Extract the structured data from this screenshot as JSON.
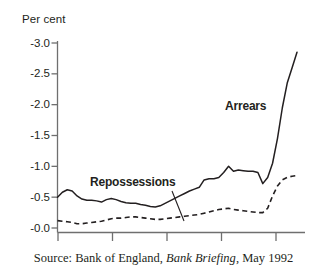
{
  "figure": {
    "axis_unit_label": "Per cent",
    "caption_prefix": "Source: Bank of England,",
    "caption_italic": "Bank Briefing",
    "caption_suffix": ", May 1992",
    "label_arrears": "Arrears",
    "label_repossessions": "Repossessions",
    "colors": {
      "ink": "#231f20",
      "axis": "#6f6f6f",
      "background": "#ffffff"
    }
  },
  "chart_data": {
    "type": "line",
    "title": "",
    "subtitle": "",
    "xlabel": "",
    "ylabel": "Per cent",
    "ylim": [
      0.0,
      3.0
    ],
    "ytick_labels": [
      "-3.0",
      "-2.5",
      "-2.0",
      "-1.5",
      "-1.0",
      "-0.5",
      "-0.0"
    ],
    "ytick_values": [
      3.0,
      2.5,
      2.0,
      1.5,
      1.0,
      0.5,
      0.0
    ],
    "xtick_labels": [
      "",
      "",
      "",
      "",
      ""
    ],
    "xtick_count": 5,
    "grid": false,
    "legend_position": "inline-annotations",
    "annotations": [
      {
        "text": "Arrears",
        "target_series": "Arrears",
        "style": "bold"
      },
      {
        "text": "Repossessions",
        "target_series": "Repossessions",
        "style": "bold",
        "leader_line": true
      }
    ],
    "series": [
      {
        "name": "Arrears",
        "style": "solid",
        "values": [
          0.5,
          0.58,
          0.62,
          0.6,
          0.52,
          0.47,
          0.45,
          0.45,
          0.44,
          0.42,
          0.46,
          0.48,
          0.46,
          0.43,
          0.41,
          0.4,
          0.4,
          0.38,
          0.37,
          0.35,
          0.34,
          0.36,
          0.4,
          0.44,
          0.48,
          0.52,
          0.56,
          0.6,
          0.63,
          0.66,
          0.78,
          0.8,
          0.8,
          0.82,
          0.9,
          1.0,
          0.92,
          0.94,
          0.93,
          0.92,
          0.92,
          0.9,
          0.72,
          0.82,
          1.05,
          1.45,
          1.95,
          2.35,
          2.6,
          2.85
        ]
      },
      {
        "name": "Repossessions",
        "style": "dashed",
        "values": [
          0.12,
          0.11,
          0.1,
          0.09,
          0.07,
          0.07,
          0.08,
          0.09,
          0.1,
          0.11,
          0.13,
          0.15,
          0.16,
          0.16,
          0.17,
          0.18,
          0.18,
          0.17,
          0.16,
          0.15,
          0.14,
          0.14,
          0.15,
          0.16,
          0.17,
          0.18,
          0.19,
          0.2,
          0.21,
          0.22,
          0.24,
          0.26,
          0.28,
          0.3,
          0.31,
          0.32,
          0.3,
          0.29,
          0.28,
          0.27,
          0.26,
          0.25,
          0.25,
          0.32,
          0.52,
          0.68,
          0.78,
          0.82,
          0.84,
          0.85
        ]
      }
    ]
  }
}
